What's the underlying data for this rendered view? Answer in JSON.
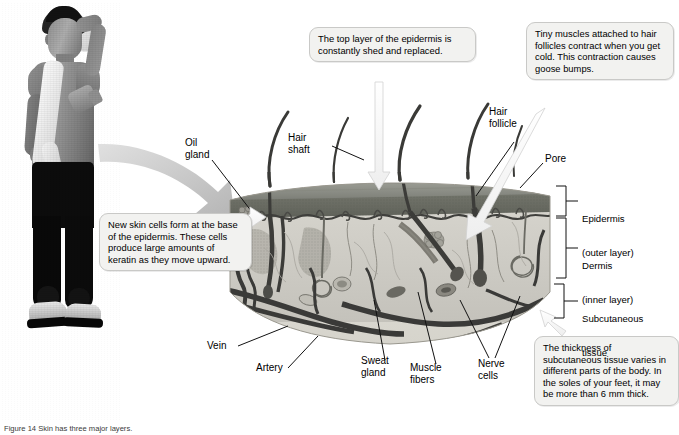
{
  "figure": {
    "domain": "biology-textbook-figure",
    "caption_prefix": "Figure 14",
    "caption_text": "Figure 14  Skin has three major layers."
  },
  "photo": {
    "alt_name": "athlete-wiping-forehead-photo",
    "description": "Young man in sweatshirt with towel wiping his forehead"
  },
  "callouts": [
    {
      "id": "top",
      "name": "callout-epidermis-shedding",
      "text": "The top layer of the epidermis is constantly shed and replaced."
    },
    {
      "id": "right",
      "name": "callout-goose-bumps",
      "text": "Tiny muscles attached to hair follicles contract when you get cold. This contraction causes goose bumps."
    },
    {
      "id": "left",
      "name": "callout-new-skin-cells",
      "text": "New skin cells form at the base of the epidermis. These cells produce large amounts of keratin as they move upward."
    },
    {
      "id": "bottom",
      "name": "callout-subcutaneous-thickness",
      "text": "The thickness of subcutaneous tissue varies in different parts of the body. In the soles of your feet, it may be more than 6 mm thick."
    }
  ],
  "labels": [
    {
      "id": "oil-gland",
      "text": "Oil\ngland"
    },
    {
      "id": "hair-shaft",
      "text": "Hair\nshaft"
    },
    {
      "id": "hair-follicle",
      "text": "Hair\nfollicle"
    },
    {
      "id": "pore",
      "text": "Pore"
    },
    {
      "id": "vein",
      "text": "Vein"
    },
    {
      "id": "artery",
      "text": "Artery"
    },
    {
      "id": "sweat-gland",
      "text": "Sweat\ngland"
    },
    {
      "id": "muscle-fibers",
      "text": "Muscle\nfibers"
    },
    {
      "id": "nerve-cells",
      "text": "Nerve\ncells"
    }
  ],
  "layers": [
    {
      "id": "epidermis",
      "name": "Epidermis",
      "sub": "(outer layer)"
    },
    {
      "id": "dermis",
      "name": "Dermis",
      "sub": "(inner layer)"
    },
    {
      "id": "subcutaneous",
      "name": "Subcutaneous",
      "sub": "tissue"
    }
  ],
  "colors": {
    "callout_fill": "#f2f2f0",
    "callout_border": "#c9c9c7",
    "epidermis_top": "#8e9088",
    "epidermis_band": "#6e7068",
    "dermis": "#cfcdc6",
    "subcutaneous": "#e3e1da",
    "vessel_dark": "#4a4a4a",
    "arrow_gray": "#c9c9c9",
    "text": "#000000"
  }
}
